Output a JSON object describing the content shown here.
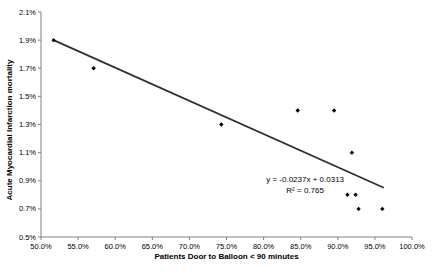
{
  "figure": {
    "background": "#ffffff",
    "axis_color": "#808080",
    "text_color": "#000000"
  },
  "chart_data": {
    "type": "scatter",
    "title": "",
    "xlabel": "Patients Door to Balloon < 90 minutes",
    "ylabel": "Acute Myocardial Infarction mortality",
    "xlim": [
      50,
      100
    ],
    "ylim": [
      0.5,
      2.1
    ],
    "grid": false,
    "legend": false,
    "x_tick_labels": [
      "50.0%",
      "55.0%",
      "60.0%",
      "65.0%",
      "70.0%",
      "75.0%",
      "80.0%",
      "85.0%",
      "90.0%",
      "95.0%",
      "100.0%"
    ],
    "y_tick_labels": [
      "2.1%",
      "1.9%",
      "1.7%",
      "1.5%",
      "1.3%",
      "1.1%",
      "0.9%",
      "0.7%",
      "0.5%"
    ],
    "series": [
      {
        "name": "AMI mortality vs door-to-balloon",
        "marker": "diamond",
        "color": "#000000",
        "points": [
          [
            51.7,
            1.9
          ],
          [
            57.1,
            1.7
          ],
          [
            74.3,
            1.3
          ],
          [
            84.6,
            1.4
          ],
          [
            89.5,
            1.4
          ],
          [
            91.9,
            1.1
          ],
          [
            91.3,
            0.8
          ],
          [
            92.4,
            0.8
          ],
          [
            92.8,
            0.7
          ],
          [
            96.0,
            0.7
          ]
        ]
      }
    ],
    "trendline": {
      "equation": "y = -0.0237x + 0.0313",
      "r_squared": "R² = 0.765",
      "color": "#2e2e2e",
      "x_start": 51.7,
      "y_start": 1.9,
      "x_end": 96.2,
      "y_end": 0.85
    },
    "annotation": {
      "lines": [
        "y = -0.0237x + 0.0313",
        "R² = 0.765"
      ],
      "x": 85.6,
      "y": 0.95
    }
  }
}
